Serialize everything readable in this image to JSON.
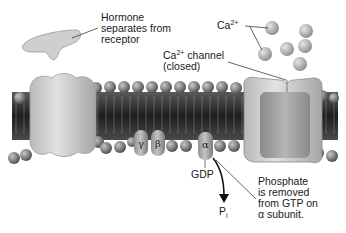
{
  "labels": {
    "hormone": [
      "Hormone",
      "separates from",
      "receptor"
    ],
    "calcium_ion": "Ca",
    "calcium_charge": "2+",
    "channel_line1_prefix": "Ca",
    "channel_line1_charge": "2+",
    "channel_line1_suffix": " channel",
    "channel_line2": "(closed)",
    "gdp": "GDP",
    "pi_main": "P",
    "pi_sub": "i",
    "phosphate": [
      "Phosphate",
      "is removed",
      "from GTP on",
      "α subunit."
    ]
  },
  "subunits": {
    "gamma": "γ",
    "beta": "β",
    "alpha": "α"
  },
  "colors": {
    "membrane_dark": "#2e2e2e",
    "head_gray": "#8a8a8a",
    "protein_light": "#cfcfcf",
    "ion_gray": "#a8a8a8",
    "text": "#1a1a1a"
  }
}
